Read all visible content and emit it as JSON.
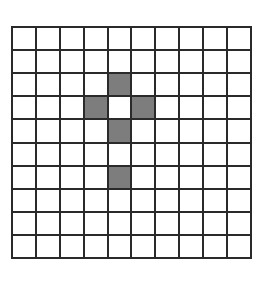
{
  "grid": {
    "rows": 10,
    "cols": 10,
    "shaded_color": "#8a8a8a",
    "line_color": "#2a2a2a",
    "shaded_cells": [
      {
        "row": 2,
        "col": 4
      },
      {
        "row": 3,
        "col": 3
      },
      {
        "row": 3,
        "col": 5
      },
      {
        "row": 4,
        "col": 4
      },
      {
        "row": 6,
        "col": 4
      }
    ]
  }
}
